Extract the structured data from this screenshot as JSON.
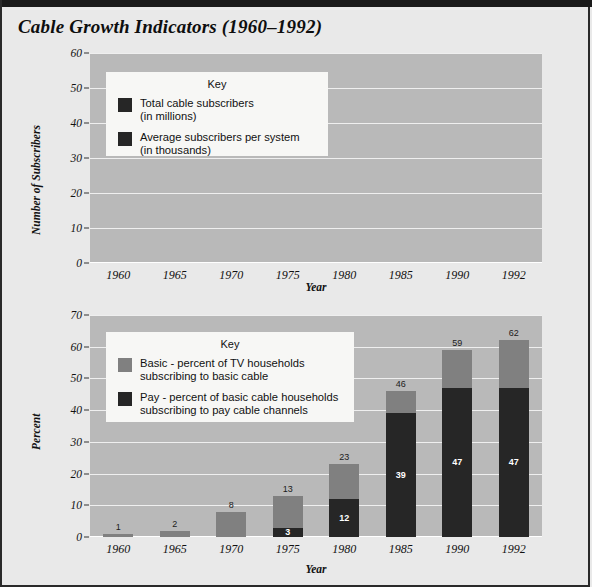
{
  "page": {
    "title": "Cable Growth Indicators (1960–1992)",
    "background": "#e9e9e9",
    "plot_background": "#b9b9b9",
    "gridline_color": "#efefef"
  },
  "colors": {
    "dark": "#262626",
    "gray": "#808080",
    "key_background": "#f7f7f5"
  },
  "chart_data": [
    {
      "type": "bar",
      "id": "subscribers",
      "title": "",
      "xlabel": "Year",
      "ylabel": "Number of Subscribers",
      "categories": [
        "1960",
        "1965",
        "1970",
        "1975",
        "1980",
        "1985",
        "1990",
        "1992"
      ],
      "ylim": [
        0,
        60
      ],
      "yticks": [
        0,
        10,
        20,
        30,
        40,
        50,
        60
      ],
      "grid": true,
      "legend_position": "upper-left-inside",
      "legend_title": "Key",
      "series": [
        {
          "name": "Total cable subscribers",
          "name_line2": "(in millions)",
          "color": "#262626",
          "values": [
            0.7,
            1.3,
            4.5,
            9.8,
            16.0,
            35.0,
            55.0,
            57.0
          ]
        },
        {
          "name": "Average subscribers per system",
          "name_line2": "(in thousands)",
          "color": "#262626",
          "values": [
            0.5,
            0.5,
            1.3,
            3.0,
            4.0,
            5.5,
            6.0,
            5.3
          ]
        }
      ]
    },
    {
      "type": "bar",
      "id": "percent",
      "title": "",
      "xlabel": "Year",
      "ylabel": "Percent",
      "categories": [
        "1960",
        "1965",
        "1970",
        "1975",
        "1980",
        "1985",
        "1990",
        "1992"
      ],
      "ylim": [
        0,
        70
      ],
      "yticks": [
        0,
        10,
        20,
        30,
        40,
        50,
        60,
        70
      ],
      "grid": true,
      "stacked": true,
      "legend_position": "upper-left-inside",
      "legend_title": "Key",
      "series": [
        {
          "name": "Basic - percent of TV households",
          "name_line2": "subscribing to basic cable",
          "color": "#808080",
          "values": [
            1,
            2,
            8,
            13,
            23,
            46,
            59,
            62
          ],
          "labels": [
            "1",
            "2",
            "8",
            "13",
            "23",
            "46",
            "59",
            "62"
          ]
        },
        {
          "name": "Pay - percent of basic cable households",
          "name_line2": "subscribing to pay cable channels",
          "color": "#262626",
          "values": [
            0,
            0,
            0,
            3,
            12,
            39,
            47,
            47
          ],
          "labels": [
            "",
            "",
            "",
            "3",
            "12",
            "39",
            "47",
            "47"
          ]
        }
      ]
    }
  ]
}
